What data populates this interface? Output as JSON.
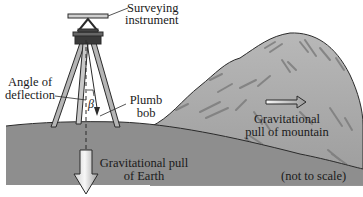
{
  "diagram": {
    "type": "illustration",
    "labels": {
      "instrument_line1": "Surveying",
      "instrument_line2": "instrument",
      "angle_line1": "Angle of",
      "angle_line2": "deflection",
      "beta_symbol": "β",
      "plumb_line1": "Plumb",
      "plumb_line2": "bob",
      "mountain_pull_line1": "Gravitational",
      "mountain_pull_line2": "pull of mountain",
      "earth_pull_line1": "Gravitational pull",
      "earth_pull_line2": "of Earth",
      "scale_note": "(not to scale)"
    },
    "colors": {
      "ground": "#8f8f8f",
      "mountain": "#a9a9a9",
      "mountain_streaks": "#777777",
      "outline": "#2a2a2a",
      "arrow_fill_light": "#f2f2f2",
      "arrow_fill_dark": "#9a9a9a"
    }
  }
}
